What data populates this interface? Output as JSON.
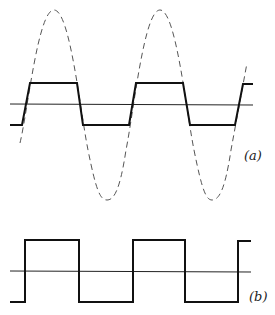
{
  "figure": {
    "panels": [
      {
        "id": "a",
        "label": "(a)",
        "description": "Sine wave (dashed) clipped to a trapezoidal wave (solid) about a horizontal axis",
        "sine_wave": {
          "style": "dashed",
          "color": "#444444"
        },
        "clipped_wave": {
          "style": "solid",
          "color": "#111111"
        },
        "axis": {
          "style": "solid",
          "color": "#222222"
        }
      },
      {
        "id": "b",
        "label": "(b)",
        "description": "Ideal square wave (solid) about a horizontal axis",
        "square_wave": {
          "style": "solid",
          "color": "#111111"
        },
        "axis": {
          "style": "solid",
          "color": "#222222"
        }
      }
    ]
  }
}
